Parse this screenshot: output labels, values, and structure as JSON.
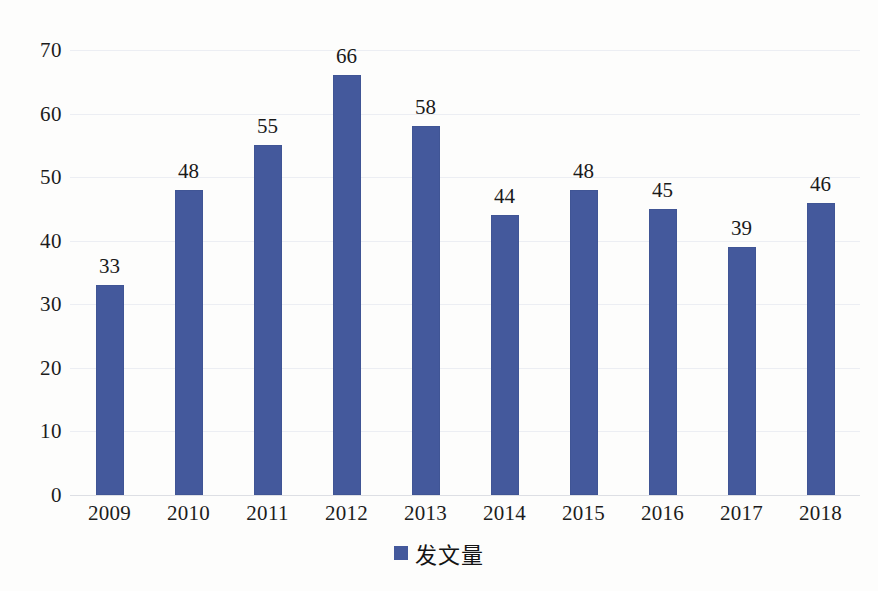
{
  "chart_data": {
    "type": "bar",
    "title": "",
    "subtitle": "",
    "xlabel": "",
    "ylabel": "",
    "categories": [
      "2009",
      "2010",
      "2011",
      "2012",
      "2013",
      "2014",
      "2015",
      "2016",
      "2017",
      "2018"
    ],
    "values": [
      33,
      48,
      55,
      66,
      58,
      44,
      48,
      45,
      39,
      46
    ],
    "series": [
      {
        "name": "发文量",
        "values": [
          33,
          48,
          55,
          66,
          58,
          44,
          48,
          45,
          39,
          46
        ],
        "color": "#44599c"
      }
    ],
    "ylim": [
      0,
      70
    ],
    "ytick_values": [
      0,
      10,
      20,
      30,
      40,
      50,
      60,
      70
    ],
    "ytick_labels": [
      "0",
      "10",
      "20",
      "30",
      "40",
      "50",
      "60",
      "70"
    ],
    "value_labels": [
      "33",
      "48",
      "55",
      "66",
      "58",
      "44",
      "48",
      "45",
      "39",
      "46"
    ],
    "grid": "horizontal",
    "grid_color": "#eceef3",
    "legend_position": "bottom-center",
    "legend_entries": [
      "发文量"
    ],
    "background_color": "#fdfdfc",
    "axis_color": "#dddfe4"
  },
  "legend": {
    "label": "发文量",
    "swatch_color": "#44599c"
  }
}
